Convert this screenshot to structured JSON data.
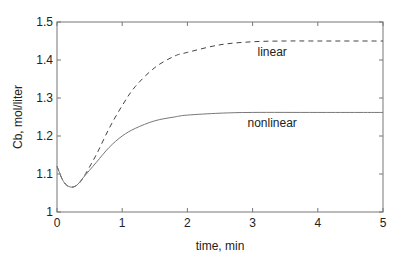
{
  "chart_data": {
    "type": "line",
    "title": "",
    "xlabel": "time,  min",
    "ylabel": "Cb, mol/liter",
    "xlim": [
      0,
      5
    ],
    "ylim": [
      1,
      1.5
    ],
    "xticks": [
      "0",
      "1",
      "2",
      "3",
      "4",
      "5"
    ],
    "yticks": [
      "1",
      "1.1",
      "1.2",
      "1.3",
      "1.4",
      "1.5"
    ],
    "grid": false,
    "legend": "inline annotations",
    "series": [
      {
        "name": "linear",
        "style": "dashed",
        "x": [
          0,
          0.1,
          0.2,
          0.3,
          0.4,
          0.6,
          0.8,
          1.0,
          1.2,
          1.5,
          1.8,
          2.0,
          2.5,
          3.0,
          3.5,
          4.0,
          5.0
        ],
        "y": [
          1.12,
          1.08,
          1.066,
          1.07,
          1.09,
          1.15,
          1.22,
          1.28,
          1.33,
          1.38,
          1.41,
          1.42,
          1.44,
          1.448,
          1.45,
          1.45,
          1.45
        ]
      },
      {
        "name": "nonlinear",
        "style": "solid",
        "x": [
          0,
          0.1,
          0.2,
          0.3,
          0.4,
          0.6,
          0.8,
          1.0,
          1.2,
          1.5,
          1.8,
          2.0,
          2.5,
          3.0,
          4.0,
          5.0
        ],
        "y": [
          1.12,
          1.08,
          1.066,
          1.07,
          1.09,
          1.13,
          1.17,
          1.2,
          1.22,
          1.24,
          1.25,
          1.255,
          1.26,
          1.262,
          1.262,
          1.262
        ]
      }
    ],
    "annotations": [
      {
        "text": "linear",
        "x": 3.3,
        "y": 1.42
      },
      {
        "text": "nonlinear",
        "x": 3.3,
        "y": 1.235
      }
    ]
  }
}
